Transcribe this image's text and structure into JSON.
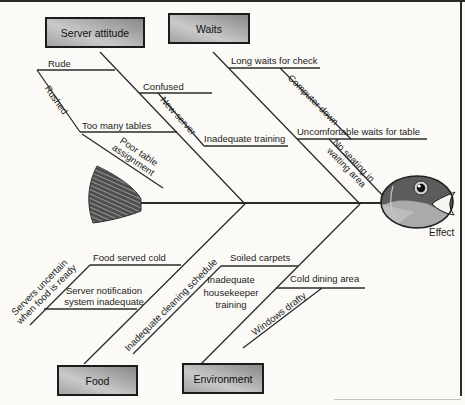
{
  "diagram": {
    "effect": "Effect",
    "server_attitude": {
      "category": "Server attitude",
      "rude": "Rude",
      "rushed": "Rushed",
      "confused": "Confused",
      "new_server": "New server",
      "too_many_tables": "Too many tables",
      "poor_table_assignment": [
        "Poor table",
        "assignment"
      ],
      "inadequate_training": "Inadequate training"
    },
    "waits": {
      "category": "Waits",
      "long_waits_for_check": "Long waits for check",
      "computer_down": "Computer down",
      "uncomfortable_waits_for_table": "Uncomfortable waits for table",
      "no_seating": [
        "No seating in",
        "waiting area"
      ]
    },
    "food": {
      "category": "Food",
      "food_served_cold": "Food served cold",
      "servers_uncertain": [
        "Servers uncertain",
        "when food is ready"
      ],
      "server_notification": [
        "Server notification",
        "system inadequate"
      ]
    },
    "environment": {
      "category": "Environment",
      "soiled_carpets": "Soiled carpets",
      "inadequate_cleaning_schedule": "Inadequate cleaning schedule",
      "inadequate_housekeeper_training": [
        "Inadequate",
        "housekeeper",
        "training"
      ],
      "cold_dining_area": "Cold dining area",
      "windows_drafty": "Windows drafty"
    },
    "colors": {
      "line": "#2b2b2b",
      "box_fill_dark": "#888888",
      "box_fill_light": "#c9c9c9",
      "fish_body": "#5c5c5c",
      "fish_cheek": "#aaaaaa"
    }
  }
}
